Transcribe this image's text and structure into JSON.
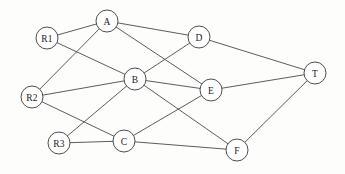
{
  "diagram": {
    "type": "undirected-node-link-graph",
    "background_color": "#fdfdfc",
    "edge_color": "#4a4a4a",
    "node_fill_color": "#ffffff",
    "node_stroke_color": "#3a3a3a",
    "label_color": "#1a1a1a",
    "node_radius": 11,
    "canvas": {
      "width": 345,
      "height": 174
    }
  },
  "nodes": [
    {
      "id": "R1",
      "label": "R1",
      "x": 47,
      "y": 38,
      "role": "source"
    },
    {
      "id": "R2",
      "label": "R2",
      "x": 32,
      "y": 97,
      "role": "source"
    },
    {
      "id": "R3",
      "label": "R3",
      "x": 59,
      "y": 143,
      "role": "source"
    },
    {
      "id": "A",
      "label": "A",
      "x": 107,
      "y": 21,
      "role": "relay"
    },
    {
      "id": "B",
      "label": "B",
      "x": 135,
      "y": 79,
      "role": "relay"
    },
    {
      "id": "C",
      "label": "C",
      "x": 124,
      "y": 141,
      "role": "relay"
    },
    {
      "id": "D",
      "label": "D",
      "x": 199,
      "y": 37,
      "role": "relay"
    },
    {
      "id": "E",
      "label": "E",
      "x": 211,
      "y": 90,
      "role": "relay"
    },
    {
      "id": "F",
      "label": "F",
      "x": 237,
      "y": 150,
      "role": "relay"
    },
    {
      "id": "T",
      "label": "T",
      "x": 315,
      "y": 73,
      "role": "sink"
    }
  ],
  "edges": [
    {
      "from": "R1",
      "to": "A"
    },
    {
      "from": "R1",
      "to": "B"
    },
    {
      "from": "R2",
      "to": "A"
    },
    {
      "from": "R2",
      "to": "B"
    },
    {
      "from": "R2",
      "to": "C"
    },
    {
      "from": "R3",
      "to": "B"
    },
    {
      "from": "R3",
      "to": "C"
    },
    {
      "from": "A",
      "to": "D"
    },
    {
      "from": "A",
      "to": "E"
    },
    {
      "from": "B",
      "to": "D"
    },
    {
      "from": "B",
      "to": "E"
    },
    {
      "from": "B",
      "to": "F"
    },
    {
      "from": "C",
      "to": "E"
    },
    {
      "from": "C",
      "to": "F"
    },
    {
      "from": "D",
      "to": "T"
    },
    {
      "from": "E",
      "to": "T"
    },
    {
      "from": "F",
      "to": "T"
    }
  ]
}
